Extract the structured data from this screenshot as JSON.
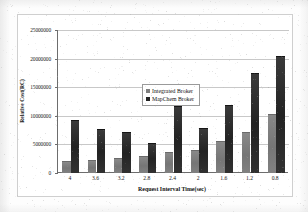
{
  "chart_data": {
    "type": "bar",
    "title": "",
    "subtitle": "",
    "xlabel": "Request Interval Time(sec)",
    "ylabel": "Relative Cost(RC)",
    "categories": [
      "4",
      "3.6",
      "3.2",
      "2.8",
      "2.4",
      "2",
      "1.6",
      "1.2",
      "0.8"
    ],
    "series": [
      {
        "name": "Integrated Broker",
        "color": "#7f7f7f",
        "values": [
          2100000,
          2300000,
          2700000,
          3000000,
          3700000,
          4100000,
          5600000,
          7200000,
          10300000
        ]
      },
      {
        "name": "MapChem Broker",
        "color": "#232323",
        "values": [
          9200000,
          7700000,
          7100000,
          5300000,
          11700000,
          7900000,
          11900000,
          17500000,
          20500000
        ]
      }
    ],
    "ylim": [
      0,
      25000000
    ],
    "ytick_values": [
      0,
      5000000,
      10000000,
      15000000,
      20000000,
      25000000
    ],
    "ytick_labels": [
      "0",
      "5000000",
      "10000000",
      "15000000",
      "20000000",
      "25000000"
    ],
    "grid": true,
    "grid_axis": "y",
    "legend_position": "upper-left-inside",
    "bar_orientation": "vertical"
  },
  "legend": {
    "entries": [
      {
        "label": "Integrated Broker",
        "swatch": "legend-swatch-integrated-broker"
      },
      {
        "label": "MapChem Broker",
        "swatch": "legend-swatch-mapchem-broker"
      }
    ]
  },
  "colors": {
    "series_light": "#7f7f7f",
    "series_dark": "#232323",
    "axis": "#6d6d6d",
    "gridline": "#c8c8c8",
    "text": "#111111",
    "page_background": "#fdfdfd",
    "plot_background": "#ffffff",
    "figure_border": "#cfcfcf"
  }
}
